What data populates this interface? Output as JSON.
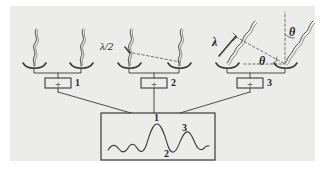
{
  "figure": {
    "kind": "antenna-array-interferometry-diagram",
    "background_color": "#ececeb",
    "page_color": "#ffffff",
    "ink_color": "#3a3a3a",
    "label_color": "#262626"
  },
  "groups": [
    {
      "id": "group-1",
      "summer_symbol": "+",
      "summer_label": "1",
      "path_label": "",
      "angle_labels": []
    },
    {
      "id": "group-2",
      "summer_symbol": "+",
      "summer_label": "2",
      "path_label": "λ/2",
      "angle_labels": []
    },
    {
      "id": "group-3",
      "summer_symbol": "+",
      "summer_label": "3",
      "path_label": "λ",
      "angle_labels": [
        "θ",
        "θ"
      ]
    }
  ],
  "output_panel": {
    "id": "interference-pattern-panel",
    "peak_labels": {
      "main_peak": "1",
      "trough": "2",
      "side_peak": "3"
    }
  }
}
